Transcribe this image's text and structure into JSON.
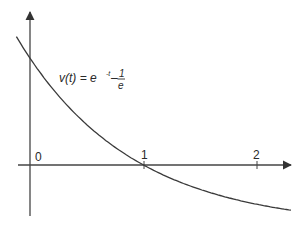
{
  "chart_data": {
    "type": "line",
    "title": "",
    "xlabel": "",
    "ylabel": "",
    "function": "v(t) = e^{-t} - 1/e",
    "annotation": {
      "text": "v(t) = e",
      "exponent": "-t",
      "minus": "–",
      "fraction_numerator": "1",
      "fraction_denominator": "e"
    },
    "x_ticks": [
      "0",
      "1",
      "2"
    ],
    "x_tick_values": [
      0,
      1,
      2
    ],
    "xlim": [
      -0.12,
      2.3
    ],
    "ylim": [
      -0.3,
      0.9
    ],
    "grid": false,
    "legend": "none",
    "series": [
      {
        "name": "v(t)",
        "x": [
          -0.12,
          0,
          0.25,
          0.5,
          0.75,
          1.0,
          1.25,
          1.5,
          1.75,
          2.0,
          2.2
        ],
        "values": [
          0.759,
          0.632,
          0.411,
          0.239,
          0.104,
          0.0,
          -0.081,
          -0.145,
          -0.194,
          -0.232,
          -0.257
        ]
      }
    ],
    "colors": {
      "curve": "#3a3a3a",
      "axes": "#3a3a3a",
      "text": "#2a2a2a"
    }
  }
}
